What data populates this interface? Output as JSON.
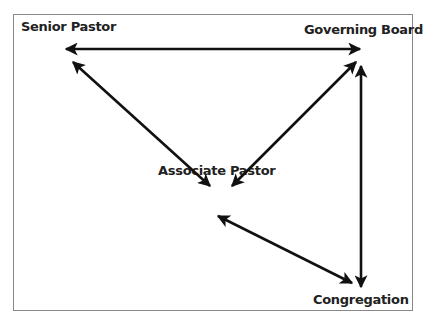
{
  "nodes": {
    "senior_pastor": "Senior Pastor",
    "governing_board": "Governing Board",
    "associate_pastor": "Associate Pastor",
    "congregation": "Congregation"
  },
  "edges": [
    {
      "from": "Senior Pastor",
      "to": "Governing Board",
      "type": "bidirectional"
    },
    {
      "from": "Senior Pastor",
      "to": "Associate Pastor",
      "type": "bidirectional"
    },
    {
      "from": "Governing Board",
      "to": "Associate Pastor",
      "type": "bidirectional"
    },
    {
      "from": "Governing Board",
      "to": "Congregation",
      "type": "bidirectional"
    },
    {
      "from": "Associate Pastor",
      "to": "Congregation",
      "type": "bidirectional"
    }
  ],
  "colors": {
    "arrow": "#111111",
    "border": "#888888",
    "text": "#222222"
  }
}
